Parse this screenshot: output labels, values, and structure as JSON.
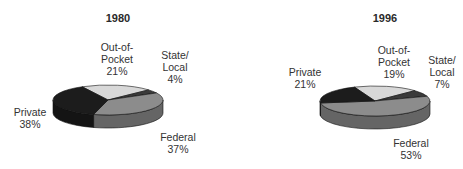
{
  "chart_data": [
    {
      "type": "pie",
      "title": "1980",
      "categories": [
        "Out-of-Pocket",
        "State/Local",
        "Federal",
        "Private"
      ],
      "values": [
        21,
        4,
        37,
        38
      ],
      "unit": "%",
      "style": "3d",
      "colors": [
        "#d8d8d8",
        "#3a3a3a",
        "#8c8c8c",
        "#1c1c1c"
      ]
    },
    {
      "type": "pie",
      "title": "1996",
      "categories": [
        "Out-of-Pocket",
        "State/Local",
        "Federal",
        "Private"
      ],
      "values": [
        19,
        7,
        53,
        21
      ],
      "unit": "%",
      "style": "3d",
      "colors": [
        "#d8d8d8",
        "#3a3a3a",
        "#8c8c8c",
        "#1c1c1c"
      ]
    }
  ],
  "charts": [
    {
      "title": "1980",
      "labels": {
        "oop_1": "Out-of-",
        "oop_2": "Pocket",
        "oop_pct": "21%",
        "sl_1": "State/",
        "sl_2": "Local",
        "sl_pct": "4%",
        "fed_1": "Federal",
        "fed_pct": "37%",
        "priv_1": "Private",
        "priv_pct": "38%"
      }
    },
    {
      "title": "1996",
      "labels": {
        "oop_1": "Out-of-",
        "oop_2": "Pocket",
        "oop_pct": "19%",
        "sl_1": "State/",
        "sl_2": "Local",
        "sl_pct": "7%",
        "fed_1": "Federal",
        "fed_pct": "53%",
        "priv_1": "Private",
        "priv_pct": "21%"
      }
    }
  ]
}
